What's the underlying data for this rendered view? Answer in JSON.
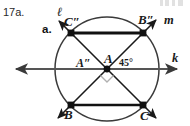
{
  "figure": {
    "exercise_number": "17a.",
    "part_label": "a.",
    "labels": {
      "line_ell": "ℓ",
      "line_m": "m",
      "line_k": "k",
      "point_C_double_prime": "C″",
      "point_B_double_prime": "B″",
      "point_A_double_prime": "A″",
      "point_A": "A",
      "point_B": "B",
      "point_C": "C",
      "angle_measure": "45°"
    },
    "colors": {
      "ink": "#111111",
      "circle_stroke": "#333333",
      "axis_stroke": "#555555",
      "right_angle_mark": "#aaaaaa"
    },
    "geometry": {
      "circle_center": [
        107,
        69
      ],
      "circle_radius": 52,
      "vertex_C_double_prime": [
        71,
        33
      ],
      "vertex_B_double_prime": [
        143,
        33
      ],
      "vertex_B": [
        71,
        105
      ],
      "vertex_C": [
        143,
        105
      ],
      "angle_between_k_and_m_degrees": 45,
      "right_angle_at_center": true
    }
  }
}
